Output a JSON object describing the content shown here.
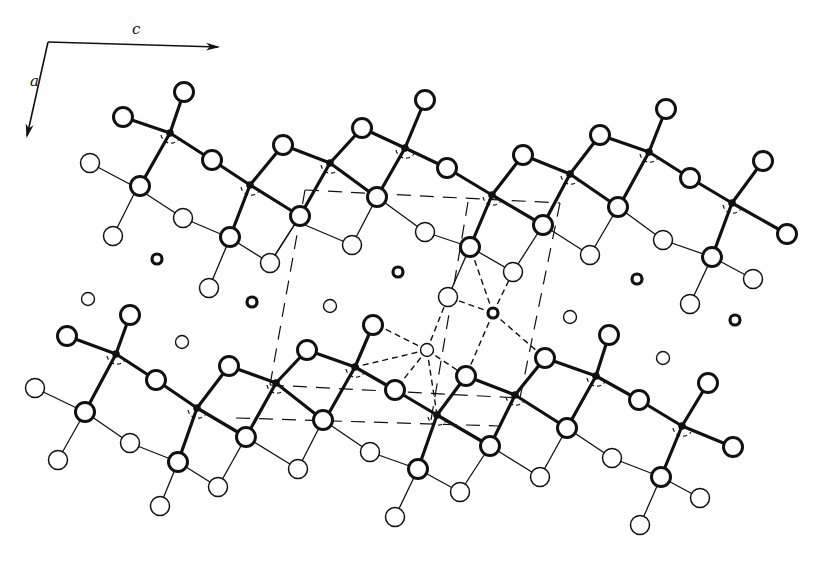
{
  "diagram": {
    "type": "crystal-structure-projection",
    "axes": {
      "c_label": "c",
      "a_label": "a",
      "origin": [
        48,
        42
      ],
      "c_end": [
        218,
        47
      ],
      "a_end": [
        27,
        136
      ]
    },
    "colors": {
      "ink": "#111111",
      "background": "#ffffff"
    },
    "legend": {
      "heavy_bonds": "upper layer bonds (thick)",
      "light_bonds": "lower layer bonds (thin)",
      "unit_cell": "dashed unit cell outline",
      "coordination": "dash-dot coordination polyhedron"
    },
    "heavy_bonds": [
      [
        [
          123,
          117
        ],
        [
          170,
          133
        ]
      ],
      [
        [
          184,
          92
        ],
        [
          170,
          133
        ]
      ],
      [
        [
          170,
          133
        ],
        [
          212,
          160
        ]
      ],
      [
        [
          170,
          133
        ],
        [
          140,
          186
        ]
      ],
      [
        [
          212,
          160
        ],
        [
          250,
          185
        ]
      ],
      [
        [
          250,
          185
        ],
        [
          283,
          145
        ]
      ],
      [
        [
          250,
          185
        ],
        [
          230,
          237
        ]
      ],
      [
        [
          250,
          185
        ],
        [
          300,
          216
        ]
      ],
      [
        [
          283,
          145
        ],
        [
          330,
          163
        ]
      ],
      [
        [
          330,
          163
        ],
        [
          300,
          216
        ]
      ],
      [
        [
          330,
          163
        ],
        [
          362,
          128
        ]
      ],
      [
        [
          330,
          163
        ],
        [
          375,
          196
        ]
      ],
      [
        [
          362,
          128
        ],
        [
          405,
          148
        ]
      ],
      [
        [
          425,
          100
        ],
        [
          405,
          148
        ]
      ],
      [
        [
          405,
          148
        ],
        [
          447,
          168
        ]
      ],
      [
        [
          405,
          148
        ],
        [
          377,
          197
        ]
      ],
      [
        [
          447,
          168
        ],
        [
          492,
          195
        ]
      ],
      [
        [
          492,
          195
        ],
        [
          523,
          155
        ]
      ],
      [
        [
          492,
          195
        ],
        [
          470,
          247
        ]
      ],
      [
        [
          492,
          195
        ],
        [
          543,
          225
        ]
      ],
      [
        [
          523,
          155
        ],
        [
          570,
          174
        ]
      ],
      [
        [
          570,
          174
        ],
        [
          543,
          225
        ]
      ],
      [
        [
          570,
          174
        ],
        [
          600,
          135
        ]
      ],
      [
        [
          570,
          174
        ],
        [
          618,
          207
        ]
      ],
      [
        [
          600,
          135
        ],
        [
          649,
          152
        ]
      ],
      [
        [
          666,
          109
        ],
        [
          649,
          152
        ]
      ],
      [
        [
          649,
          152
        ],
        [
          690,
          178
        ]
      ],
      [
        [
          649,
          152
        ],
        [
          620,
          205
        ]
      ],
      [
        [
          690,
          178
        ],
        [
          732,
          203
        ]
      ],
      [
        [
          732,
          203
        ],
        [
          763,
          161
        ]
      ],
      [
        [
          732,
          203
        ],
        [
          712,
          257
        ]
      ],
      [
        [
          732,
          203
        ],
        [
          787,
          234
        ]
      ],
      [
        [
          67,
          336
        ],
        [
          116,
          354
        ]
      ],
      [
        [
          130,
          315
        ],
        [
          116,
          354
        ]
      ],
      [
        [
          116,
          354
        ],
        [
          156,
          380
        ]
      ],
      [
        [
          116,
          354
        ],
        [
          85,
          412
        ]
      ],
      [
        [
          156,
          380
        ],
        [
          197,
          408
        ]
      ],
      [
        [
          197,
          408
        ],
        [
          229,
          366
        ]
      ],
      [
        [
          197,
          408
        ],
        [
          178,
          462
        ]
      ],
      [
        [
          197,
          408
        ],
        [
          246,
          437
        ]
      ],
      [
        [
          229,
          366
        ],
        [
          276,
          383
        ]
      ],
      [
        [
          276,
          383
        ],
        [
          246,
          437
        ]
      ],
      [
        [
          276,
          383
        ],
        [
          307,
          350
        ]
      ],
      [
        [
          276,
          383
        ],
        [
          323,
          420
        ]
      ],
      [
        [
          307,
          350
        ],
        [
          355,
          367
        ]
      ],
      [
        [
          373,
          325
        ],
        [
          355,
          367
        ]
      ],
      [
        [
          355,
          367
        ],
        [
          395,
          390
        ]
      ],
      [
        [
          355,
          367
        ],
        [
          325,
          420
        ]
      ],
      [
        [
          395,
          390
        ],
        [
          437,
          415
        ]
      ],
      [
        [
          437,
          415
        ],
        [
          466,
          376
        ]
      ],
      [
        [
          437,
          415
        ],
        [
          418,
          469
        ]
      ],
      [
        [
          437,
          415
        ],
        [
          490,
          446
        ]
      ],
      [
        [
          466,
          376
        ],
        [
          515,
          395
        ]
      ],
      [
        [
          515,
          395
        ],
        [
          490,
          446
        ]
      ],
      [
        [
          515,
          395
        ],
        [
          545,
          358
        ]
      ],
      [
        [
          515,
          395
        ],
        [
          567,
          428
        ]
      ],
      [
        [
          545,
          358
        ],
        [
          596,
          376
        ]
      ],
      [
        [
          609,
          335
        ],
        [
          596,
          376
        ]
      ],
      [
        [
          596,
          376
        ],
        [
          639,
          400
        ]
      ],
      [
        [
          596,
          376
        ],
        [
          567,
          428
        ]
      ],
      [
        [
          639,
          400
        ],
        [
          682,
          426
        ]
      ],
      [
        [
          682,
          426
        ],
        [
          708,
          383
        ]
      ],
      [
        [
          682,
          426
        ],
        [
          661,
          477
        ]
      ],
      [
        [
          682,
          426
        ],
        [
          733,
          447
        ]
      ]
    ],
    "light_bonds": [
      [
        [
          90,
          163
        ],
        [
          137,
          188
        ]
      ],
      [
        [
          137,
          188
        ],
        [
          113,
          236
        ]
      ],
      [
        [
          137,
          188
        ],
        [
          183,
          218
        ]
      ],
      [
        [
          183,
          218
        ],
        [
          230,
          238
        ]
      ],
      [
        [
          230,
          238
        ],
        [
          270,
          263
        ]
      ],
      [
        [
          230,
          238
        ],
        [
          209,
          288
        ]
      ],
      [
        [
          300,
          216
        ],
        [
          270,
          263
        ]
      ],
      [
        [
          270,
          263
        ],
        [
          300,
          216
        ]
      ],
      [
        [
          377,
          197
        ],
        [
          352,
          245
        ]
      ],
      [
        [
          352,
          245
        ],
        [
          305,
          225
        ]
      ],
      [
        [
          377,
          197
        ],
        [
          425,
          232
        ]
      ],
      [
        [
          425,
          232
        ],
        [
          470,
          247
        ]
      ],
      [
        [
          470,
          247
        ],
        [
          513,
          272
        ]
      ],
      [
        [
          470,
          247
        ],
        [
          448,
          297
        ]
      ],
      [
        [
          543,
          225
        ],
        [
          513,
          272
        ]
      ],
      [
        [
          618,
          207
        ],
        [
          590,
          255
        ]
      ],
      [
        [
          590,
          255
        ],
        [
          543,
          225
        ]
      ],
      [
        [
          618,
          207
        ],
        [
          663,
          240
        ]
      ],
      [
        [
          663,
          240
        ],
        [
          712,
          257
        ]
      ],
      [
        [
          712,
          257
        ],
        [
          753,
          279
        ]
      ],
      [
        [
          712,
          257
        ],
        [
          690,
          304
        ]
      ],
      [
        [
          35,
          388
        ],
        [
          85,
          412
        ]
      ],
      [
        [
          85,
          412
        ],
        [
          58,
          460
        ]
      ],
      [
        [
          85,
          412
        ],
        [
          130,
          443
        ]
      ],
      [
        [
          130,
          443
        ],
        [
          178,
          462
        ]
      ],
      [
        [
          178,
          462
        ],
        [
          218,
          487
        ]
      ],
      [
        [
          178,
          462
        ],
        [
          160,
          506
        ]
      ],
      [
        [
          246,
          437
        ],
        [
          218,
          487
        ]
      ],
      [
        [
          323,
          420
        ],
        [
          298,
          469
        ]
      ],
      [
        [
          298,
          469
        ],
        [
          246,
          437
        ]
      ],
      [
        [
          323,
          420
        ],
        [
          370,
          452
        ]
      ],
      [
        [
          370,
          452
        ],
        [
          418,
          469
        ]
      ],
      [
        [
          418,
          469
        ],
        [
          460,
          492
        ]
      ],
      [
        [
          418,
          469
        ],
        [
          395,
          517
        ]
      ],
      [
        [
          490,
          446
        ],
        [
          460,
          492
        ]
      ],
      [
        [
          567,
          428
        ],
        [
          540,
          477
        ]
      ],
      [
        [
          540,
          477
        ],
        [
          490,
          446
        ]
      ],
      [
        [
          567,
          428
        ],
        [
          612,
          458
        ]
      ],
      [
        [
          612,
          458
        ],
        [
          661,
          477
        ]
      ],
      [
        [
          661,
          477
        ],
        [
          700,
          498
        ]
      ],
      [
        [
          661,
          477
        ],
        [
          640,
          525
        ]
      ]
    ],
    "unit_cell_dashes": [
      [
        [
          305,
          190
        ],
        [
          560,
          203
        ]
      ],
      [
        [
          560,
          203
        ],
        [
          520,
          398
        ]
      ],
      [
        [
          270,
          385
        ],
        [
          520,
          398
        ]
      ],
      [
        [
          305,
          190
        ],
        [
          270,
          385
        ]
      ],
      [
        [
          236,
          418
        ],
        [
          498,
          426
        ]
      ],
      [
        [
          468,
          202
        ],
        [
          430,
          426
        ]
      ]
    ],
    "coordination_dashes": [
      [
        [
          427,
          350
        ],
        [
          377,
          325
        ]
      ],
      [
        [
          427,
          350
        ],
        [
          448,
          297
        ]
      ],
      [
        [
          427,
          350
        ],
        [
          466,
          376
        ]
      ],
      [
        [
          427,
          350
        ],
        [
          437,
          415
        ]
      ],
      [
        [
          427,
          350
        ],
        [
          395,
          390
        ]
      ],
      [
        [
          427,
          350
        ],
        [
          355,
          367
        ]
      ],
      [
        [
          493,
          313
        ],
        [
          448,
          297
        ]
      ],
      [
        [
          493,
          313
        ],
        [
          513,
          272
        ]
      ],
      [
        [
          493,
          313
        ],
        [
          466,
          376
        ]
      ],
      [
        [
          493,
          313
        ],
        [
          545,
          358
        ]
      ],
      [
        [
          493,
          313
        ],
        [
          470,
          247
        ]
      ]
    ],
    "open_atoms_heavy": [
      [
        123,
        117
      ],
      [
        184,
        92
      ],
      [
        212,
        160
      ],
      [
        283,
        145
      ],
      [
        362,
        128
      ],
      [
        425,
        100
      ],
      [
        447,
        168
      ],
      [
        523,
        155
      ],
      [
        600,
        135
      ],
      [
        666,
        109
      ],
      [
        690,
        178
      ],
      [
        763,
        161
      ],
      [
        787,
        234
      ],
      [
        140,
        186
      ],
      [
        230,
        237
      ],
      [
        300,
        216
      ],
      [
        377,
        197
      ],
      [
        470,
        247
      ],
      [
        543,
        225
      ],
      [
        618,
        207
      ],
      [
        712,
        257
      ],
      [
        67,
        336
      ],
      [
        130,
        315
      ],
      [
        156,
        380
      ],
      [
        229,
        366
      ],
      [
        307,
        350
      ],
      [
        373,
        325
      ],
      [
        395,
        390
      ],
      [
        466,
        376
      ],
      [
        545,
        358
      ],
      [
        609,
        335
      ],
      [
        639,
        400
      ],
      [
        708,
        383
      ],
      [
        733,
        447
      ],
      [
        85,
        412
      ],
      [
        178,
        462
      ],
      [
        246,
        437
      ],
      [
        323,
        420
      ],
      [
        418,
        469
      ],
      [
        490,
        446
      ],
      [
        567,
        428
      ],
      [
        661,
        477
      ]
    ],
    "open_atoms_light": [
      [
        90,
        163
      ],
      [
        113,
        236
      ],
      [
        183,
        218
      ],
      [
        209,
        288
      ],
      [
        270,
        263
      ],
      [
        352,
        245
      ],
      [
        425,
        232
      ],
      [
        448,
        297
      ],
      [
        513,
        272
      ],
      [
        590,
        255
      ],
      [
        663,
        240
      ],
      [
        690,
        304
      ],
      [
        753,
        279
      ],
      [
        35,
        388
      ],
      [
        58,
        460
      ],
      [
        130,
        443
      ],
      [
        160,
        506
      ],
      [
        218,
        487
      ],
      [
        298,
        469
      ],
      [
        370,
        452
      ],
      [
        395,
        517
      ],
      [
        460,
        492
      ],
      [
        540,
        477
      ],
      [
        612,
        458
      ],
      [
        640,
        525
      ],
      [
        700,
        498
      ]
    ],
    "small_atoms": [
      [
        88,
        299
      ],
      [
        182,
        342
      ],
      [
        330,
        306
      ],
      [
        427,
        350
      ],
      [
        570,
        317
      ],
      [
        663,
        358
      ]
    ],
    "thick_ring_atoms": [
      [
        157,
        259
      ],
      [
        252,
        302
      ],
      [
        398,
        272
      ],
      [
        493,
        313
      ],
      [
        637,
        279
      ],
      [
        735,
        320
      ]
    ],
    "center_atoms": [
      [
        170,
        133
      ],
      [
        250,
        185
      ],
      [
        330,
        163
      ],
      [
        405,
        148
      ],
      [
        492,
        195
      ],
      [
        570,
        174
      ],
      [
        649,
        152
      ],
      [
        732,
        203
      ],
      [
        116,
        354
      ],
      [
        197,
        408
      ],
      [
        276,
        383
      ],
      [
        355,
        367
      ],
      [
        437,
        415
      ],
      [
        515,
        395
      ],
      [
        596,
        376
      ],
      [
        682,
        426
      ]
    ]
  }
}
